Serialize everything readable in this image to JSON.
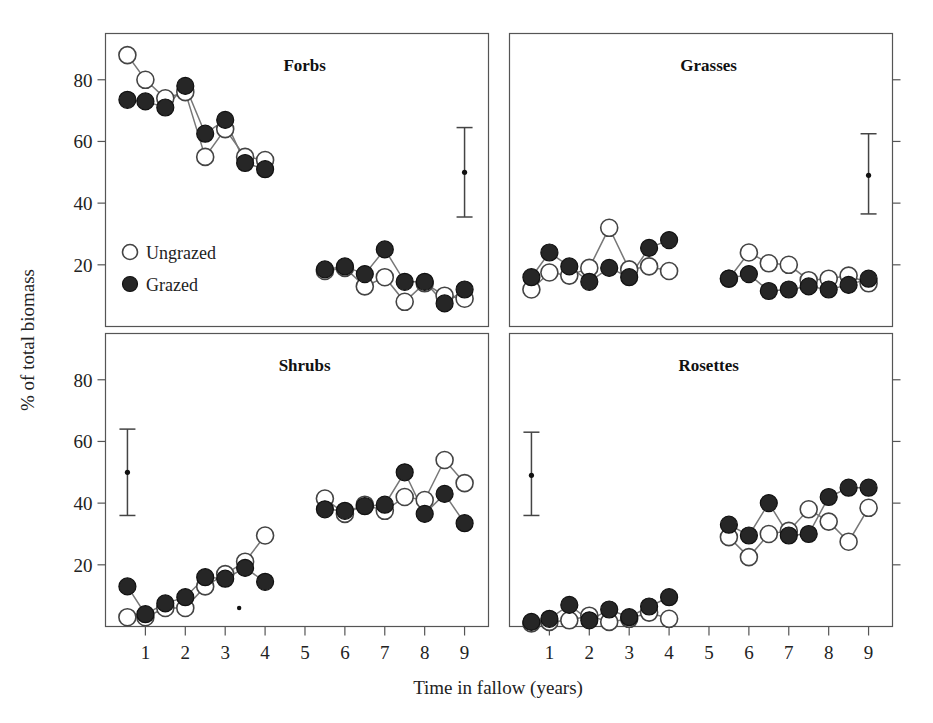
{
  "figure": {
    "xlabel": "Time in fallow (years)",
    "ylabel": "% of total biomass",
    "legend": {
      "ungrazed_label": "Ungrazed",
      "grazed_label": "Grazed",
      "ungrazed_marker": "open-circle",
      "grazed_marker": "filled-circle"
    },
    "colors": {
      "grazed_fill": "#262626",
      "ungrazed_fill": "#ffffff",
      "line": "#777777",
      "frame": "#555555",
      "text": "#222222"
    }
  },
  "chart_data": {
    "type": "line",
    "title": "",
    "xlabel": "Time in fallow (years)",
    "ylabel": "% of total biomass",
    "xlim": [
      0,
      9.6
    ],
    "ylim": [
      0,
      95
    ],
    "xticks": [
      1,
      2,
      3,
      4,
      5,
      6,
      7,
      8,
      9
    ],
    "yticks": [
      20,
      40,
      60,
      80
    ],
    "grid": false,
    "legend": [
      "Ungrazed",
      "Grazed"
    ],
    "legend_position": "inside-left-forbs-panel",
    "panels": [
      {
        "name": "Forbs",
        "row": 0,
        "col": 0,
        "errorbar": {
          "x": 9.0,
          "y": 50,
          "low": 35.5,
          "high": 64.5
        },
        "groups": [
          {
            "block": "left",
            "x": [
              0.55,
              1.0,
              1.5,
              2.0,
              2.5,
              3.0,
              3.5,
              4.0
            ],
            "ungrazed": [
              88,
              80,
              74,
              76,
              55,
              64,
              55,
              54
            ],
            "grazed": [
              73.5,
              73,
              71,
              78,
              62.5,
              67,
              53,
              51
            ]
          },
          {
            "block": "right",
            "x": [
              5.5,
              6.0,
              6.5,
              7.0,
              7.5,
              8.0,
              8.5,
              9.0
            ],
            "ungrazed": [
              18,
              19,
              13,
              16,
              8,
              14,
              10,
              9
            ],
            "grazed": [
              18.5,
              19.5,
              17,
              25,
              14.5,
              14.5,
              7.5,
              12
            ]
          }
        ]
      },
      {
        "name": "Grasses",
        "row": 0,
        "col": 1,
        "errorbar": {
          "x": 9.0,
          "y": 49,
          "low": 36.5,
          "high": 62.5
        },
        "groups": [
          {
            "block": "left",
            "x": [
              0.55,
              1.0,
              1.5,
              2.0,
              2.5,
              3.0,
              3.5,
              4.0
            ],
            "ungrazed": [
              12,
              17.5,
              16.5,
              19,
              32,
              18.5,
              19.5,
              18
            ],
            "grazed": [
              16,
              24,
              19.5,
              14.5,
              19,
              16,
              25.5,
              28
            ]
          },
          {
            "block": "right",
            "x": [
              5.5,
              6.0,
              6.5,
              7.0,
              7.5,
              8.0,
              8.5,
              9.0
            ],
            "ungrazed": [
              15.5,
              24,
              20.5,
              20,
              15,
              15.5,
              16.5,
              14
            ],
            "grazed": [
              15.5,
              17,
              11.5,
              12,
              13,
              12,
              13.5,
              15.5
            ]
          }
        ]
      },
      {
        "name": "Shrubs",
        "row": 1,
        "col": 0,
        "errorbar": {
          "x": 0.55,
          "y": 50,
          "low": 36,
          "high": 64
        },
        "groups": [
          {
            "block": "left",
            "x": [
              0.55,
              1.0,
              1.5,
              2.0,
              2.5,
              3.0,
              3.5,
              4.0
            ],
            "ungrazed": [
              3,
              3,
              6,
              6,
              13,
              17,
              21,
              29.5
            ],
            "grazed": [
              13,
              4,
              7.5,
              9.5,
              16,
              15.5,
              19,
              14.5
            ]
          },
          {
            "block": "right",
            "x": [
              5.5,
              6.0,
              6.5,
              7.0,
              7.5,
              8.0,
              8.5,
              9.0
            ],
            "ungrazed": [
              41.5,
              36.5,
              39.5,
              37.5,
              42,
              41,
              54,
              46.5
            ],
            "grazed": [
              38,
              37.5,
              39,
              39.5,
              50,
              36.5,
              43,
              33.5
            ]
          }
        ],
        "stray_marker": {
          "x": 3.35,
          "y": 6,
          "style": "tiny-dot"
        }
      },
      {
        "name": "Rosettes",
        "row": 1,
        "col": 1,
        "errorbar": {
          "x": 0.55,
          "y": 49,
          "low": 36,
          "high": 63
        },
        "groups": [
          {
            "block": "left",
            "x": [
              0.55,
              1.0,
              1.5,
              2.0,
              2.5,
              3.0,
              3.5,
              4.0
            ],
            "ungrazed": [
              1,
              1.5,
              2,
              3.5,
              1.5,
              2.5,
              4.5,
              2.5
            ],
            "grazed": [
              1.5,
              2.5,
              7,
              2,
              5.5,
              3,
              6.5,
              9.5
            ]
          },
          {
            "block": "right",
            "x": [
              5.5,
              6.0,
              6.5,
              7.0,
              7.5,
              8.0,
              8.5,
              9.0
            ],
            "ungrazed": [
              29,
              22.5,
              30,
              31,
              38,
              34,
              27.5,
              38.5
            ],
            "grazed": [
              33,
              29.5,
              40,
              29.5,
              30,
              42,
              45,
              45
            ]
          }
        ]
      }
    ]
  }
}
